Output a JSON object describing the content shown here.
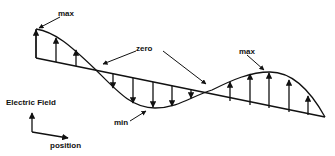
{
  "diagram": {
    "colors": {
      "stroke": "#111111",
      "background": "#ffffff"
    },
    "labels": {
      "max_left": "max",
      "zero": "zero",
      "max_right": "max",
      "min": "min",
      "axis_y": "Electric Field",
      "axis_x": "position"
    },
    "annotations": [
      {
        "text": "max",
        "points_to": "left crest"
      },
      {
        "text": "zero",
        "points_to": "both axis crossings"
      },
      {
        "text": "max",
        "points_to": "right crest"
      },
      {
        "text": "min",
        "points_to": "trough"
      }
    ],
    "field_vectors": {
      "up_left": 3,
      "down": 6,
      "up_right": 5
    }
  }
}
